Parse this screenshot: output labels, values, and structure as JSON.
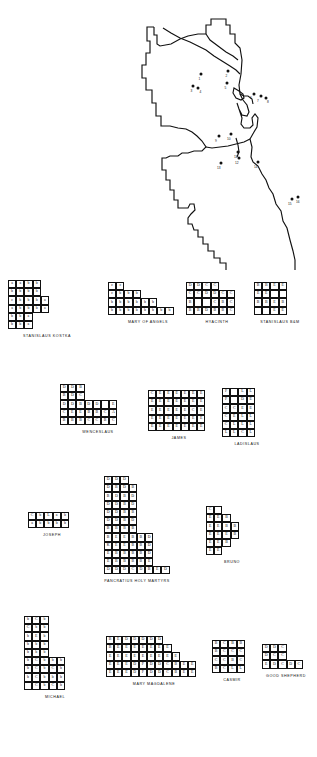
{
  "figure": {
    "map": {
      "name": "chicago-city-outline-map",
      "description": "Outline map of Chicago with parish location markers",
      "markers": [
        {
          "label": "1",
          "x": 61,
          "y": 68
        },
        {
          "label": "2",
          "x": 87,
          "y": 66
        },
        {
          "label": "3",
          "x": 55,
          "y": 80
        },
        {
          "label": "4",
          "x": 58,
          "y": 82
        },
        {
          "label": "5",
          "x": 86,
          "y": 78
        },
        {
          "label": "6",
          "x": 114,
          "y": 88
        },
        {
          "label": "7",
          "x": 120,
          "y": 90
        },
        {
          "label": "8",
          "x": 124,
          "y": 92
        },
        {
          "label": "9",
          "x": 80,
          "y": 130
        },
        {
          "label": "10",
          "x": 91,
          "y": 128
        },
        {
          "label": "11",
          "x": 98,
          "y": 146
        },
        {
          "label": "12",
          "x": 100,
          "y": 150
        },
        {
          "label": "13",
          "x": 82,
          "y": 157
        },
        {
          "label": "14",
          "x": 118,
          "y": 156
        },
        {
          "label": "15",
          "x": 185,
          "y": 194
        },
        {
          "label": "16",
          "x": 190,
          "y": 192
        }
      ]
    },
    "diagrams": [
      {
        "id": "stanislaus-kostka",
        "label": "STANISLAUS KOSTKA",
        "rows": [
          [
            "a",
            "a",
            "b",
            "b"
          ],
          [
            "b",
            "b",
            "b",
            "b"
          ],
          [
            "c",
            "b",
            "b",
            "b",
            "a"
          ],
          [
            "a",
            "b",
            "b",
            "b",
            "a"
          ],
          [
            "b",
            "b",
            "a"
          ],
          [
            "b",
            "b",
            "a"
          ]
        ]
      },
      {
        "id": "mary-of-angels",
        "label": "MARY OF ANGELS",
        "rows": [
          [
            "c",
            "c"
          ],
          [
            "c",
            "b",
            "b",
            "b"
          ],
          [
            "b",
            "b",
            "b",
            "b",
            "b",
            "b"
          ],
          [
            "b",
            "b",
            "b",
            "b",
            "b",
            "b",
            "b",
            "b"
          ]
        ]
      },
      {
        "id": "hyacinth",
        "label": "HYACINTH",
        "rows": [
          [
            "D",
            "D",
            "C",
            "C"
          ],
          [
            "C",
            "C",
            "D",
            "D",
            "C",
            "C"
          ],
          [
            "B",
            "",
            "",
            "C",
            "B",
            "C"
          ],
          [
            "B",
            "B",
            "D",
            "B",
            "B",
            "C"
          ]
        ]
      },
      {
        "id": "stanislaus-bm",
        "label": "STANISLAUS B&M",
        "rows": [
          [
            "B",
            "B",
            "E",
            "E"
          ],
          [
            "E",
            "E",
            "",
            ""
          ],
          [
            "B",
            "B",
            "E",
            "B"
          ],
          [
            "",
            "",
            "E",
            "E"
          ]
        ]
      },
      {
        "id": "wenceslaus",
        "label": "WENCESLAUS",
        "rows": [
          [
            "D",
            "D",
            "B"
          ],
          [
            "B",
            "D",
            "C"
          ],
          [
            "D",
            "D",
            "B",
            "D",
            "D",
            "",
            "E"
          ],
          [
            "C",
            "E",
            "E",
            "B",
            "B",
            "C",
            "A"
          ],
          [
            "B",
            "B",
            "B",
            "C",
            "C",
            "B",
            "C"
          ]
        ]
      },
      {
        "id": "james",
        "label": "JAMES",
        "rows": [
          [
            "C",
            "E",
            "E",
            "E",
            "E",
            "E",
            "E"
          ],
          [
            "E",
            "E",
            "E",
            "E",
            "E",
            "E",
            "E"
          ],
          [
            "E",
            "E",
            "E",
            "E",
            "E",
            "C",
            "E"
          ],
          [
            "E",
            "E",
            "E",
            "E",
            "E",
            "E",
            "E"
          ],
          [
            "E",
            "E",
            "E",
            "E",
            "E",
            "E",
            "E"
          ]
        ]
      },
      {
        "id": "ladislaus",
        "label": "LADISLAUS",
        "rows": [
          [
            "F",
            "",
            "L",
            "L"
          ],
          [
            "F",
            "",
            "D",
            "E"
          ],
          [
            "C",
            "C",
            "E",
            "E"
          ],
          [
            "C",
            "E",
            "L",
            "L"
          ],
          [
            "C",
            "L",
            "L",
            "L"
          ],
          [
            "L",
            "L",
            "C",
            "L"
          ]
        ]
      },
      {
        "id": "joseph",
        "label": "JOSEPH",
        "rows": [
          [
            "C",
            "b",
            "L",
            "a",
            "b"
          ],
          [
            "a",
            "b",
            "b",
            "b",
            "b"
          ]
        ]
      },
      {
        "id": "pancratius-holy-martyrs",
        "label": "PANCRATIUS HOLY MARTYRS",
        "rows": [
          [
            "D",
            "D",
            "D"
          ],
          [
            "D",
            "B",
            "D",
            "B"
          ],
          [
            "B",
            "D",
            "B",
            "D"
          ],
          [
            "D",
            "D",
            "B",
            "D"
          ],
          [
            "D",
            "D",
            "B",
            "B"
          ],
          [
            "D",
            "D",
            "B",
            "D"
          ],
          [
            "B",
            "B",
            "B",
            "B"
          ],
          [
            "B",
            "E",
            "E",
            "B",
            "B",
            "D"
          ],
          [
            "K",
            "E",
            "E",
            "B",
            "B",
            "D"
          ],
          [
            "E",
            "B",
            "B",
            "B",
            "B",
            "D"
          ],
          [
            "E",
            "B",
            "B",
            "B",
            "B",
            "E"
          ],
          [
            "D",
            "D",
            "D",
            "C",
            "D",
            "B",
            "E",
            "D"
          ]
        ]
      },
      {
        "id": "bruno",
        "label": "BRUNO",
        "rows": [
          [
            "C",
            ""
          ],
          [
            "E",
            "E",
            "B"
          ],
          [
            "E",
            "E",
            "B",
            "B"
          ],
          [
            "E",
            "E",
            "E",
            "B"
          ],
          [
            "E",
            "E",
            "B"
          ],
          [
            "E",
            "E"
          ]
        ]
      },
      {
        "id": "michael",
        "label": "MICHAEL",
        "rows": [
          [
            "b",
            "C",
            "b"
          ],
          [
            "C",
            "b",
            "b"
          ],
          [
            "b",
            "E",
            "b"
          ],
          [
            "b",
            "b",
            "b"
          ],
          [
            "b",
            "b",
            "b"
          ],
          [
            "b",
            "C",
            "b",
            "b",
            "b"
          ],
          [
            "b",
            "C",
            "b",
            "C",
            "b"
          ],
          [
            "b",
            "C",
            "b",
            "b",
            "b"
          ],
          [
            "",
            "C",
            "b",
            "C",
            "b"
          ]
        ]
      },
      {
        "id": "mary-magdalene",
        "label": "MARY MAGDALENE",
        "rows": [
          [
            "B",
            "E",
            "D",
            "D",
            "D",
            "D",
            "D"
          ],
          [
            "B",
            "E",
            "E",
            "E",
            "E",
            "E",
            "E",
            "E"
          ],
          [
            "E",
            "E",
            "E",
            "E",
            "E",
            "E",
            "E",
            "E",
            "E"
          ],
          [
            "E",
            "E",
            "E",
            "D",
            "F",
            "D",
            "D",
            "C",
            "B",
            "E",
            "E"
          ],
          [
            "E",
            "E",
            "E",
            "D",
            "F",
            "D",
            "D",
            "C",
            "B",
            "E",
            "E"
          ]
        ]
      },
      {
        "id": "casimir",
        "label": "CASMIR",
        "rows": [
          [
            "B",
            "C",
            "B",
            "B"
          ],
          [
            "B",
            "C",
            "C",
            "C"
          ],
          [
            "C",
            "C",
            "B",
            "C"
          ],
          [
            "B",
            "C",
            "L",
            "L"
          ]
        ]
      },
      {
        "id": "good-shepherd",
        "label": "GOOD SHEPHERD",
        "rows": [
          [
            "D",
            "D",
            "C"
          ],
          [
            "D",
            "C",
            "C"
          ],
          [
            "E",
            "D",
            "C",
            "D",
            "C"
          ]
        ]
      }
    ]
  }
}
